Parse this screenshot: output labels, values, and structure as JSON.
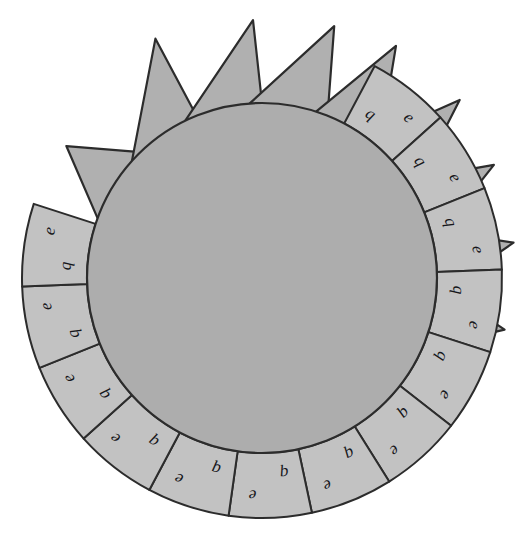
{
  "figure": {
    "background_color": "#ffffff",
    "disc": {
      "name": "central-disc",
      "fill": "#adadad",
      "stroke": "#2c2c2c",
      "center_x": 262,
      "center_y": 278,
      "radius": 175
    },
    "ring": {
      "name": "outer-segment-ring",
      "fill": "#c2c2c2",
      "stroke": "#2c2c2c",
      "inner_radius": 175,
      "outer_radius": 240,
      "segment_count": 13,
      "start_angle_deg": -62,
      "end_angle_deg": 198
    },
    "spikes": {
      "name": "triangular-spikes",
      "fill": "#b0b0b0",
      "stroke": "#2c2c2c",
      "count": 9,
      "base_radius": 175,
      "tip_radius": 252
    },
    "letters": {
      "inner_glyph": "q",
      "outer_glyph": "e"
    }
  },
  "segments": [
    {
      "index": 1,
      "inner_letter": "q",
      "outer_letter": "e",
      "angle_deg": -52
    },
    {
      "index": 2,
      "inner_letter": "q",
      "outer_letter": "e",
      "angle_deg": -32
    },
    {
      "index": 3,
      "inner_letter": "q",
      "outer_letter": "e",
      "angle_deg": -12
    },
    {
      "index": 4,
      "inner_letter": "q",
      "outer_letter": "e",
      "angle_deg": 8
    },
    {
      "index": 5,
      "inner_letter": "q",
      "outer_letter": "e",
      "angle_deg": 28
    },
    {
      "index": 6,
      "inner_letter": "q",
      "outer_letter": "e",
      "angle_deg": 48
    },
    {
      "index": 7,
      "inner_letter": "q",
      "outer_letter": "e",
      "angle_deg": 68
    },
    {
      "index": 8,
      "inner_letter": "q",
      "outer_letter": "e",
      "angle_deg": 88
    },
    {
      "index": 9,
      "inner_letter": "q",
      "outer_letter": "e",
      "angle_deg": 108
    },
    {
      "index": 10,
      "inner_letter": "q",
      "outer_letter": "e",
      "angle_deg": 128
    },
    {
      "index": 11,
      "inner_letter": "q",
      "outer_letter": "e",
      "angle_deg": 148
    },
    {
      "index": 12,
      "inner_letter": "q",
      "outer_letter": "e",
      "angle_deg": 168
    },
    {
      "index": 13,
      "inner_letter": "q",
      "outer_letter": "e",
      "angle_deg": 188
    }
  ],
  "spikes": [
    {
      "index": 1,
      "base_start_deg": 200,
      "base_end_deg": 226,
      "tip_deg": 214,
      "tip_radius": 236
    },
    {
      "index": 2,
      "base_start_deg": 222,
      "base_end_deg": 248,
      "tip_deg": 246,
      "tip_radius": 262
    },
    {
      "index": 3,
      "base_start_deg": 244,
      "base_end_deg": 270,
      "tip_deg": 268,
      "tip_radius": 258
    },
    {
      "index": 4,
      "base_start_deg": 266,
      "base_end_deg": 292,
      "tip_deg": 286,
      "tip_radius": 262
    },
    {
      "index": 5,
      "base_start_deg": 288,
      "base_end_deg": 312,
      "tip_deg": 300,
      "tip_radius": 268
    },
    {
      "index": 6,
      "base_start_deg": 308,
      "base_end_deg": 330,
      "tip_deg": 318,
      "tip_radius": 266
    },
    {
      "index": 7,
      "base_start_deg": 326,
      "base_end_deg": 348,
      "tip_deg": 334,
      "tip_radius": 258
    },
    {
      "index": 8,
      "base_start_deg": 344,
      "base_end_deg": 366,
      "tip_deg": 352,
      "tip_radius": 254
    },
    {
      "index": 9,
      "base_start_deg": 362,
      "base_end_deg": 384,
      "tip_deg": 372,
      "tip_radius": 248
    }
  ]
}
